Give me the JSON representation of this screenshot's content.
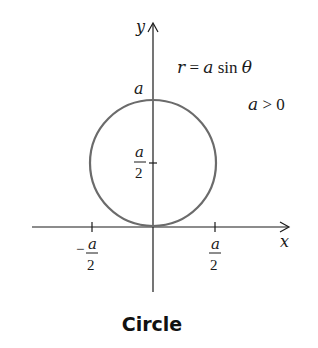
{
  "diagram": {
    "equation": "r = a sin θ",
    "eq_r": "r",
    "eq_eq": " = ",
    "eq_a": "a",
    "eq_sin": " sin ",
    "eq_theta": "θ",
    "condition_a": "a",
    "condition_rest": " > 0",
    "x_axis_label": "x",
    "y_axis_label": "y",
    "top_label": "a",
    "mid_label_num": "a",
    "mid_label_den": "2",
    "neg_tick_sign": "−",
    "neg_tick_num": "a",
    "neg_tick_den": "2",
    "pos_tick_num": "a",
    "pos_tick_den": "2",
    "caption": "Circle",
    "curve_color": "#6b6b6b",
    "axis_color": "#1a1a1a"
  }
}
